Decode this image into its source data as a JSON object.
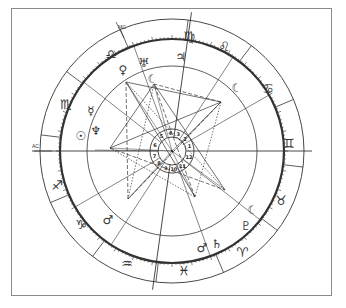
{
  "chart": {
    "title": "",
    "center": [
      172,
      151
    ],
    "radii": {
      "outer": 132,
      "zodiac_inner": 112,
      "aspect_circle": 85,
      "house_ring_outer": 22,
      "house_ring_inner": 14
    },
    "angles": {
      "ac_label": "AC",
      "mc_label": "MC"
    },
    "signs": [
      {
        "name": "virgo",
        "glyph": "♍",
        "x": 189,
        "y": 36
      },
      {
        "name": "leo",
        "glyph": "♌",
        "x": 224,
        "y": 46
      },
      {
        "name": "cancer",
        "glyph": "♋",
        "x": 268,
        "y": 88
      },
      {
        "name": "gemini",
        "glyph": "♊",
        "x": 289,
        "y": 143
      },
      {
        "name": "taurus",
        "glyph": "♉",
        "x": 281,
        "y": 200
      },
      {
        "name": "aries",
        "glyph": "♈",
        "x": 242,
        "y": 252
      },
      {
        "name": "pisces",
        "glyph": "♓",
        "x": 184,
        "y": 270
      },
      {
        "name": "aquarius",
        "glyph": "♒",
        "x": 127,
        "y": 263
      },
      {
        "name": "capricorn",
        "glyph": "♑",
        "x": 81,
        "y": 224
      },
      {
        "name": "sagittarius",
        "glyph": "♐",
        "x": 57,
        "y": 185
      },
      {
        "name": "scorpio",
        "glyph": "♏",
        "x": 66,
        "y": 104
      },
      {
        "name": "libra",
        "glyph": "♎",
        "x": 111,
        "y": 54
      }
    ],
    "planets": [
      {
        "name": "venus",
        "glyph": "♀",
        "x": 123,
        "y": 70
      },
      {
        "name": "uranus",
        "glyph": "♅",
        "x": 144,
        "y": 63
      },
      {
        "name": "moon-node",
        "glyph": "☾",
        "x": 153,
        "y": 79
      },
      {
        "name": "jupiter",
        "glyph": "♃",
        "x": 181,
        "y": 57
      },
      {
        "name": "moon",
        "glyph": "☾",
        "x": 237,
        "y": 88
      },
      {
        "name": "mercury",
        "glyph": "☿",
        "x": 91,
        "y": 111
      },
      {
        "name": "sun",
        "glyph": "☉",
        "x": 81,
        "y": 136
      },
      {
        "name": "neptune",
        "glyph": "♆",
        "x": 96,
        "y": 131
      },
      {
        "name": "moon-dark",
        "glyph": "☾",
        "x": 253,
        "y": 210
      },
      {
        "name": "pluto",
        "glyph": "♇",
        "x": 246,
        "y": 226
      },
      {
        "name": "saturn",
        "glyph": "♄",
        "x": 217,
        "y": 244
      },
      {
        "name": "mars-small",
        "glyph": "♂",
        "x": 202,
        "y": 248
      },
      {
        "name": "mars",
        "glyph": "♂",
        "x": 108,
        "y": 220
      }
    ],
    "house_numbers": [
      "1",
      "2",
      "3",
      "4",
      "5",
      "6",
      "7",
      "8",
      "9",
      "10",
      "11",
      "12"
    ],
    "house_cusps_deg": [
      180,
      210,
      237,
      262,
      290,
      322,
      0,
      30,
      57,
      82,
      110,
      142
    ],
    "aspect_points": [
      [
        221,
        102
      ],
      [
        110,
        148
      ],
      [
        128,
        199
      ],
      [
        195,
        197
      ],
      [
        126,
        82
      ],
      [
        154,
        84
      ],
      [
        225,
        190
      ],
      [
        95,
        150
      ]
    ],
    "aspects": [
      [
        0,
        1
      ],
      [
        0,
        2
      ],
      [
        0,
        3
      ],
      [
        0,
        4
      ],
      [
        0,
        5
      ],
      [
        1,
        3
      ],
      [
        1,
        5
      ],
      [
        2,
        4
      ],
      [
        2,
        5
      ],
      [
        3,
        4
      ],
      [
        3,
        5
      ],
      [
        4,
        6
      ],
      [
        5,
        6
      ],
      [
        1,
        6
      ],
      [
        2,
        0
      ]
    ],
    "line_color": "#333333",
    "frame_color": "#8a8a8a"
  }
}
